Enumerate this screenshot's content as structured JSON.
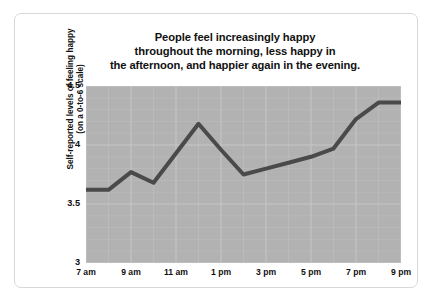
{
  "figure": {
    "title_lines": [
      "People feel increasingly happy",
      "throughout the morning, less happy in",
      "the afternoon, and happier again in the evening."
    ],
    "y_axis_title_lines": [
      "Self-reported levels of feeling happy",
      "(on a 0-to-6 scale)"
    ],
    "colors": {
      "plot_background": "#b2b2b2",
      "gridline": "#c9c9c9",
      "line": "#4a4a4a",
      "text": "#111111",
      "card_border": "#d8d8d8",
      "page_background": "#ffffff"
    }
  },
  "chart_data": {
    "type": "line",
    "title": "People feel increasingly happy throughout the morning, less happy in the afternoon, and happier again in the evening.",
    "xlabel": "",
    "ylabel": "Self-reported levels of feeling happy (on a 0-to-6 scale)",
    "x": [
      "7 am",
      "8 am",
      "9 am",
      "10 am",
      "11 am",
      "12 pm",
      "1 pm",
      "2 pm",
      "3 pm",
      "4 pm",
      "5 pm",
      "6 pm",
      "7 pm",
      "8 pm",
      "9 pm"
    ],
    "values": [
      3.62,
      3.62,
      3.77,
      3.68,
      3.93,
      4.18,
      3.96,
      3.75,
      3.8,
      3.85,
      3.9,
      3.97,
      4.22,
      4.36,
      4.36
    ],
    "series": [
      {
        "name": "Self-reported happiness",
        "values": [
          3.62,
          3.62,
          3.77,
          3.68,
          3.93,
          4.18,
          3.96,
          3.75,
          3.8,
          3.85,
          3.9,
          3.97,
          4.22,
          4.36,
          4.36
        ]
      }
    ],
    "x_tick_labels": [
      "7 am",
      "9 am",
      "11 am",
      "1 pm",
      "3 pm",
      "5 pm",
      "7 pm",
      "9 pm"
    ],
    "x_tick_indices": [
      0,
      2,
      4,
      6,
      8,
      10,
      12,
      14
    ],
    "y_tick_labels": [
      "3",
      "3.5",
      "4",
      "4.5"
    ],
    "y_ticks": [
      3,
      3.5,
      4,
      4.5
    ],
    "ylim": [
      3,
      4.5
    ],
    "xlim": [
      0,
      14
    ],
    "grid": true,
    "legend": "none",
    "line_width": 4
  }
}
